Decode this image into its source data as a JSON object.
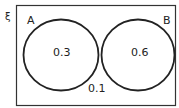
{
  "diagram": {
    "type": "venn",
    "universal_symbol": "ξ",
    "sets": [
      {
        "name": "A",
        "value": "0.3"
      },
      {
        "name": "B",
        "value": "0.6"
      }
    ],
    "outside_value": "0.1"
  }
}
